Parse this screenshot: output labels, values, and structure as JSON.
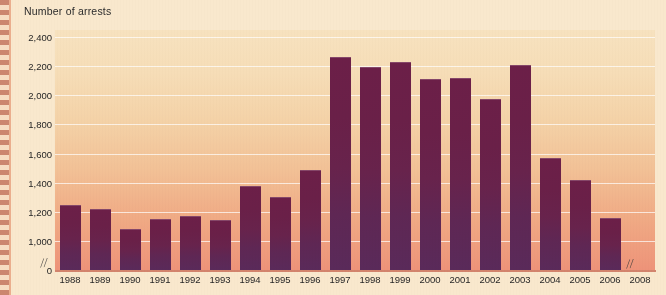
{
  "chart_data": {
    "type": "bar",
    "title": "Number of arrests",
    "xlabel": "",
    "ylabel": "Number of arrests",
    "ylim": [
      1000,
      2400
    ],
    "y_axis_broken": true,
    "y_break_from": 0,
    "y_break_to": 1000,
    "x_axis_broken": true,
    "grid": true,
    "legend": "none",
    "yticks": [
      "2,400",
      "2,200",
      "2,000",
      "1,800",
      "1,600",
      "1,400",
      "1,200",
      "1,000",
      "0"
    ],
    "ytick_values": [
      2400,
      2200,
      2000,
      1800,
      1600,
      1400,
      1200,
      1000,
      0
    ],
    "categories": [
      "1988",
      "1989",
      "1990",
      "1991",
      "1992",
      "1993",
      "1994",
      "1995",
      "1996",
      "1997",
      "1998",
      "1999",
      "2000",
      "2001",
      "2002",
      "2003",
      "2004",
      "2005",
      "2006",
      "2008"
    ],
    "values": [
      1245,
      1220,
      1080,
      1150,
      1175,
      1145,
      1380,
      1305,
      1485,
      2265,
      2195,
      2230,
      2115,
      2120,
      1975,
      2210,
      1570,
      1420,
      1160,
      null
    ],
    "colors": {
      "bar_top": "#6C1F48",
      "bar_bottom": "#5A2A5A",
      "plot_bg_top": "#F7E2BF",
      "plot_bg_bottom": "#EE9379",
      "page_bg": "#F9E8CD",
      "gridline": "#FFFFFF",
      "text": "#262626",
      "perforation": "#C9816A"
    }
  },
  "axis_break_glyph": "//"
}
